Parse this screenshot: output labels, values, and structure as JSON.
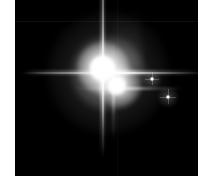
{
  "image": {
    "title": "Pluto system",
    "background_color": "#ffffff",
    "frame_color": "#000000",
    "frame": {
      "x": 15,
      "y": 0,
      "width": 183,
      "height": 176
    },
    "caption": "",
    "objects": [
      {
        "name": "Pluto",
        "role": "primary",
        "x": 88,
        "y": 68,
        "brightness": "saturated",
        "color": "#ffffff",
        "has_diffraction_spikes": true
      },
      {
        "name": "Charon",
        "role": "secondary",
        "x": 101,
        "y": 85,
        "brightness": "saturated",
        "color": "#ffffff",
        "has_diffraction_spikes": true
      },
      {
        "name": "Nix",
        "role": "moon",
        "x": 137,
        "y": 79,
        "brightness": "faint",
        "color": "#ffffff",
        "has_diffraction_spikes": true
      },
      {
        "name": "Hydra",
        "role": "moon",
        "x": 153,
        "y": 97,
        "brightness": "faint",
        "color": "#ffffff",
        "has_diffraction_spikes": true
      }
    ],
    "features": {
      "diffraction_spike_orientation": "cross",
      "mosaic_seam_horizontal_y": 21,
      "mosaic_seam_vertical_x": 102
    }
  }
}
